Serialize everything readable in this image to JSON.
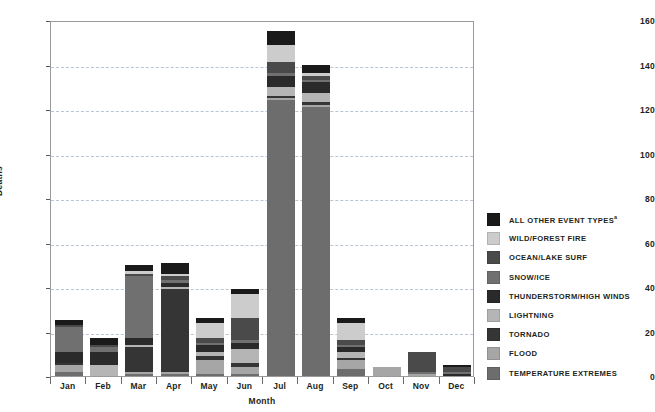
{
  "chart_data": {
    "type": "bar",
    "subtype": "stacked-bar",
    "title": "",
    "xlabel": "Month",
    "ylabel": "Deaths",
    "ylim": [
      0,
      160
    ],
    "ytick_step": 20,
    "yticks": [
      0,
      20,
      40,
      60,
      80,
      100,
      120,
      140,
      160
    ],
    "grid": true,
    "grid_style": "dashed-horizontal",
    "legend_position": "right",
    "categories": [
      "Jan",
      "Feb",
      "Mar",
      "Apr",
      "May",
      "Jun",
      "Jul",
      "Aug",
      "Sep",
      "Oct",
      "Nov",
      "Dec"
    ],
    "series": [
      {
        "name": "TEMPERATURE EXTREMES",
        "color": "#6d6d6d",
        "values": [
          2,
          0,
          1,
          1,
          1,
          1,
          124,
          121,
          3,
          0,
          0,
          0
        ]
      },
      {
        "name": "FLOOD",
        "color": "#a6a6a6",
        "values": [
          3,
          0,
          1,
          1,
          6,
          3,
          1,
          1,
          4,
          4,
          1,
          0
        ]
      },
      {
        "name": "TORNADO",
        "color": "#353535",
        "values": [
          1,
          0,
          11,
          37,
          2,
          2,
          1,
          1,
          1,
          0,
          0,
          0
        ]
      },
      {
        "name": "LIGHTNING",
        "color": "#b5b5b5",
        "values": [
          0,
          5,
          1,
          1,
          2,
          6,
          4,
          4,
          3,
          0,
          0,
          0
        ]
      },
      {
        "name": "THUNDERSTORM/HIGH WINDS",
        "color": "#2a2a2a",
        "values": [
          5,
          6,
          3,
          2,
          3,
          3,
          5,
          5,
          2,
          0,
          0,
          1
        ]
      },
      {
        "name": "SNOW/ICE",
        "color": "#707070",
        "values": [
          11,
          2,
          28,
          1,
          1,
          1,
          1,
          1,
          1,
          0,
          1,
          1
        ]
      },
      {
        "name": "OCEAN/LAKE SURF",
        "color": "#4a4a4a",
        "values": [
          1,
          1,
          1,
          2,
          2,
          10,
          5,
          2,
          2,
          0,
          9,
          2
        ]
      },
      {
        "name": "WILD/FOREST FIRE",
        "color": "#cccccc",
        "values": [
          0,
          0,
          1,
          1,
          7,
          11,
          8,
          1,
          8,
          0,
          0,
          0
        ]
      },
      {
        "name": "ALL OTHER EVENT TYPES",
        "color": "#1a1a1a",
        "values": [
          2,
          3,
          3,
          5,
          2,
          2,
          6,
          4,
          2,
          0,
          0,
          1
        ]
      }
    ],
    "totals": [
      25,
      17,
      50,
      51,
      26,
      39,
      155,
      140,
      26,
      4,
      11,
      5
    ]
  },
  "legend": {
    "items": [
      {
        "label": "ALL OTHER EVENT TYPES",
        "superscript": "a",
        "color": "#1a1a1a"
      },
      {
        "label": "WILD/FOREST FIRE",
        "superscript": "",
        "color": "#cccccc"
      },
      {
        "label": "OCEAN/LAKE SURF",
        "superscript": "",
        "color": "#4a4a4a"
      },
      {
        "label": "SNOW/ICE",
        "superscript": "",
        "color": "#707070"
      },
      {
        "label": "THUNDERSTORM/HIGH WINDS",
        "superscript": "",
        "color": "#2a2a2a"
      },
      {
        "label": "LIGHTNING",
        "superscript": "",
        "color": "#b5b5b5"
      },
      {
        "label": "TORNADO",
        "superscript": "",
        "color": "#353535"
      },
      {
        "label": "FLOOD",
        "superscript": "",
        "color": "#a6a6a6"
      },
      {
        "label": "TEMPERATURE EXTREMES",
        "superscript": "",
        "color": "#6d6d6d"
      }
    ]
  },
  "axes": {
    "y_title": "Deaths",
    "x_title": "Month"
  },
  "colors": {
    "grid": "#b9c4d4",
    "axis": "#9a9a9a",
    "text": "#231f20",
    "background": "#ffffff"
  }
}
